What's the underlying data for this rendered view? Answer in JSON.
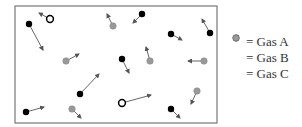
{
  "diagram": {
    "container": {
      "x": 15,
      "y": 6,
      "width": 202,
      "height": 117,
      "stroke": "#777777"
    },
    "colors": {
      "gas_a": "#000000",
      "gas_b_stroke": "#000000",
      "gas_b_fill": "#ffffff",
      "gas_c": "#999999",
      "arrow": "#555555"
    },
    "particles": [
      {
        "type": "A",
        "x": 29,
        "y": 24,
        "vx": 43,
        "vy": 50
      },
      {
        "type": "B",
        "x": 50,
        "y": 19,
        "vx": 39,
        "vy": 13
      },
      {
        "type": "C",
        "x": 113,
        "y": 26,
        "vx": 107,
        "vy": 14
      },
      {
        "type": "A",
        "x": 142,
        "y": 14,
        "vx": 133,
        "vy": 23
      },
      {
        "type": "A",
        "x": 171,
        "y": 34,
        "vx": 182,
        "vy": 40
      },
      {
        "type": "A",
        "x": 210,
        "y": 33,
        "vx": 202,
        "vy": 19
      },
      {
        "type": "C",
        "x": 66,
        "y": 61,
        "vx": 79,
        "vy": 54
      },
      {
        "type": "A",
        "x": 122,
        "y": 59,
        "vx": 129,
        "vy": 73
      },
      {
        "type": "C",
        "x": 150,
        "y": 61,
        "vx": 146,
        "vy": 47
      },
      {
        "type": "C",
        "x": 204,
        "y": 61,
        "vx": 188,
        "vy": 61
      },
      {
        "type": "A",
        "x": 80,
        "y": 94,
        "vx": 99,
        "vy": 74
      },
      {
        "type": "A",
        "x": 26,
        "y": 112,
        "vx": 44,
        "vy": 107
      },
      {
        "type": "C",
        "x": 72,
        "y": 109,
        "vx": 81,
        "vy": 118
      },
      {
        "type": "B",
        "x": 122,
        "y": 103,
        "vx": 151,
        "vy": 95
      },
      {
        "type": "A",
        "x": 171,
        "y": 109,
        "vx": 180,
        "vy": 118
      },
      {
        "type": "C",
        "x": 197,
        "y": 91,
        "vx": 191,
        "vy": 104
      }
    ]
  },
  "legend": {
    "items": [
      {
        "type": "A",
        "label": "= Gas A"
      },
      {
        "type": "B",
        "label": "= Gas B"
      },
      {
        "type": "C",
        "label": "= Gas C"
      }
    ]
  }
}
